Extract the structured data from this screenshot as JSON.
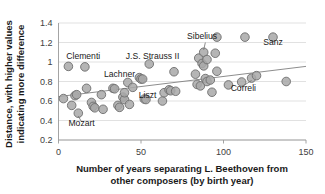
{
  "chart_data": {
    "type": "scatter",
    "title": "",
    "xlabel": "Number of years separating L. Beethoven from other composers (by birth year)",
    "ylabel": "Distance, with higher values indicating more difference",
    "xlabel_line1": "Number of years separating L. Beethoven from",
    "xlabel_line2": "other composers (by birth year)",
    "ylabel_line1": "Distance, with higher values",
    "ylabel_line2": "indicating more difference",
    "xlim": [
      0,
      150
    ],
    "ylim": [
      0.2,
      1.4
    ],
    "xticks": [
      0,
      50,
      100,
      150
    ],
    "xtick_labels": [
      "0",
      "50",
      "100",
      "150"
    ],
    "yticks": [
      0.2,
      0.4,
      0.6,
      0.8,
      1.0,
      1.2,
      1.4
    ],
    "ytick_labels": [
      "0.2",
      "0.4",
      "0.6",
      "0.8",
      "1",
      "1.2",
      "1.4"
    ],
    "grid": "horizontal",
    "legend": "none",
    "marker_fill": "#a8a8a8",
    "marker_edge": "#6e6e6e",
    "marker_size": 6.2,
    "trendline": {
      "x": [
        0,
        150
      ],
      "y": [
        0.645,
        0.955
      ],
      "color": "#808080"
    },
    "points": [
      {
        "x": 3,
        "y": 0.625
      },
      {
        "x": 6,
        "y": 0.955
      },
      {
        "x": 8,
        "y": 0.555
      },
      {
        "x": 10,
        "y": 0.655
      },
      {
        "x": 11,
        "y": 0.665
      },
      {
        "x": 12,
        "y": 0.475
      },
      {
        "x": 16,
        "y": 0.95
      },
      {
        "x": 17,
        "y": 0.73
      },
      {
        "x": 20,
        "y": 0.585
      },
      {
        "x": 21,
        "y": 0.545
      },
      {
        "x": 22,
        "y": 0.53
      },
      {
        "x": 26,
        "y": 0.665
      },
      {
        "x": 27,
        "y": 0.515
      },
      {
        "x": 33,
        "y": 0.73
      },
      {
        "x": 34,
        "y": 0.725
      },
      {
        "x": 36,
        "y": 0.555
      },
      {
        "x": 37,
        "y": 0.535
      },
      {
        "x": 39,
        "y": 0.64
      },
      {
        "x": 40,
        "y": 0.615
      },
      {
        "x": 40,
        "y": 0.685
      },
      {
        "x": 42,
        "y": 0.79
      },
      {
        "x": 43,
        "y": 0.565
      },
      {
        "x": 45,
        "y": 0.74
      },
      {
        "x": 49,
        "y": 0.84
      },
      {
        "x": 50,
        "y": 0.825
      },
      {
        "x": 51,
        "y": 0.825
      },
      {
        "x": 52,
        "y": 0.62
      },
      {
        "x": 53,
        "y": 0.615
      },
      {
        "x": 55,
        "y": 0.98
      },
      {
        "x": 63,
        "y": 0.6
      },
      {
        "x": 64,
        "y": 0.685
      },
      {
        "x": 67,
        "y": 0.715
      },
      {
        "x": 68,
        "y": 0.705
      },
      {
        "x": 70,
        "y": 0.9
      },
      {
        "x": 71,
        "y": 0.7
      },
      {
        "x": 83,
        "y": 0.875
      },
      {
        "x": 84,
        "y": 0.77
      },
      {
        "x": 85,
        "y": 1.04
      },
      {
        "x": 86,
        "y": 0.755
      },
      {
        "x": 87,
        "y": 0.985
      },
      {
        "x": 88,
        "y": 0.96
      },
      {
        "x": 88,
        "y": 1.1
      },
      {
        "x": 89,
        "y": 0.83
      },
      {
        "x": 90,
        "y": 0.8
      },
      {
        "x": 90,
        "y": 1.025
      },
      {
        "x": 92,
        "y": 0.815
      },
      {
        "x": 93,
        "y": 0.69
      },
      {
        "x": 95,
        "y": 1.09
      },
      {
        "x": 96,
        "y": 0.905
      },
      {
        "x": 96,
        "y": 1.255
      },
      {
        "x": 103,
        "y": 0.765
      },
      {
        "x": 111,
        "y": 0.795
      },
      {
        "x": 113,
        "y": 1.255
      },
      {
        "x": 117,
        "y": 0.835
      },
      {
        "x": 120,
        "y": 0.86
      },
      {
        "x": 130,
        "y": 1.255
      },
      {
        "x": 138,
        "y": 0.8
      }
    ],
    "annotations": [
      {
        "text": "Clementi",
        "x": 15,
        "y": 1.035,
        "anchor": "middle",
        "leader": false
      },
      {
        "text": "J.S. Strauss II",
        "x": 57,
        "y": 1.035,
        "anchor": "middle",
        "leader": false
      },
      {
        "text": "Sibelius",
        "x": 87,
        "y": 1.235,
        "anchor": "middle",
        "leader": true,
        "lx1": 89,
        "ly1": 1.2,
        "lx2": 88,
        "ly2": 1.125
      },
      {
        "text": "Sanz",
        "x": 130,
        "y": 1.175,
        "anchor": "middle",
        "leader": false
      },
      {
        "text": "Lachner",
        "x": 37,
        "y": 0.845,
        "anchor": "middle",
        "leader": false
      },
      {
        "text": "Liszt",
        "x": 54,
        "y": 0.635,
        "anchor": "middle",
        "leader": false
      },
      {
        "text": "Correli",
        "x": 112,
        "y": 0.7,
        "anchor": "middle",
        "leader": true,
        "lx1": 110,
        "ly1": 0.735,
        "lx2": 117,
        "ly2": 0.81
      },
      {
        "text": "Mozart",
        "x": 14,
        "y": 0.34,
        "anchor": "middle",
        "leader": true,
        "lx1": 14,
        "ly1": 0.385,
        "lx2": 12,
        "ly2": 0.445
      }
    ]
  }
}
